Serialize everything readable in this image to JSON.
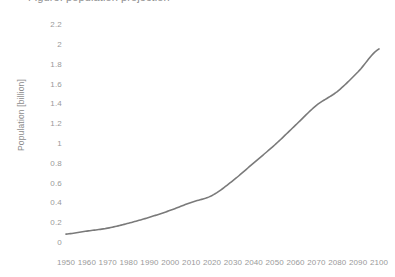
{
  "chart_data": {
    "type": "line",
    "title": "Figure: population projection",
    "xlabel": "",
    "ylabel": "Population [billion]",
    "xlim": [
      1950,
      2100
    ],
    "ylim": [
      0,
      2.2
    ],
    "grid": false,
    "legend": null,
    "line_color": "#7a7a7a",
    "x": [
      1950,
      1960,
      1970,
      1980,
      1990,
      2000,
      2010,
      2020,
      2030,
      2040,
      2050,
      2060,
      2070,
      2080,
      2090,
      2100
    ],
    "xticklabels": [
      "1950",
      "1960",
      "1970",
      "1980",
      "1990",
      "2000",
      "2010",
      "2020",
      "2030",
      "2040",
      "2050",
      "2060",
      "2070",
      "2080",
      "2090",
      "2100"
    ],
    "yticks": [
      0,
      0.2,
      0.4,
      0.6,
      0.8,
      1,
      1.2,
      1.4,
      1.6,
      1.8,
      2,
      2.2
    ],
    "yticklabels": [
      "0",
      "0.2",
      "0.4",
      "0.6",
      "0.8",
      "1",
      "1.2",
      "1.4",
      "1.6",
      "1.8",
      "2",
      "2.2"
    ],
    "series": [
      {
        "name": "Population",
        "values": [
          0.08,
          0.11,
          0.14,
          0.19,
          0.25,
          0.32,
          0.4,
          0.47,
          0.62,
          0.8,
          0.98,
          1.18,
          1.38,
          1.52,
          1.72,
          1.95
        ]
      }
    ]
  },
  "colors": {
    "line": "#7a7a7a",
    "tick_label": "#9a9a9a",
    "axis_title": "#8c8c8c",
    "background": "#ffffff"
  }
}
